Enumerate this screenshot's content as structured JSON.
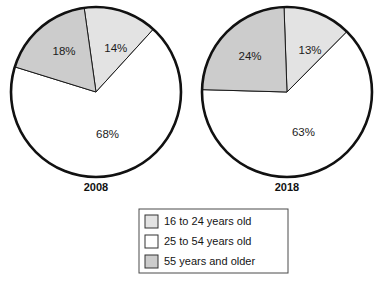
{
  "figure": {
    "title": "",
    "background": "#ffffff"
  },
  "colors": {
    "young": "#e3e3e3",
    "prime": "#ffffff",
    "older": "#cccccc",
    "outline": "#111111",
    "slice_stroke": "#1a1a1a",
    "text": "#141414",
    "legend_border": "#4a4a4a"
  },
  "chart_data": {
    "type": "pie",
    "title": "",
    "subtitle": "",
    "xlabel": "",
    "ylabel": "",
    "legend_position": "bottom-center",
    "grid": false,
    "categories": [
      "16 to 24 years old",
      "25 to 54 years old",
      "55 years and older"
    ],
    "charts": [
      {
        "name": "2008",
        "label": "2008",
        "center": {
          "x": 96,
          "y": 92
        },
        "radius": 85,
        "start_angle_deg": -8,
        "slices": [
          {
            "category": "16 to 24 years old",
            "value": 14,
            "label": "14%",
            "color_key": "young",
            "label_r_frac": 0.55,
            "label_dx": 6,
            "label_dy": 2
          },
          {
            "category": "25 to 54 years old",
            "value": 68,
            "label": "68%",
            "color_key": "prime",
            "label_r_frac": 0.52,
            "label_dx": 0,
            "label_dy": 0
          },
          {
            "category": "55 years and older",
            "value": 18,
            "label": "18%",
            "color_key": "older",
            "label_r_frac": 0.58,
            "label_dx": 0,
            "label_dy": -2
          }
        ]
      },
      {
        "name": "2018",
        "label": "2018",
        "center": {
          "x": 287,
          "y": 92
        },
        "radius": 85,
        "start_angle_deg": -2,
        "slices": [
          {
            "category": "16 to 24 years old",
            "value": 13,
            "label": "13%",
            "color_key": "young",
            "label_r_frac": 0.55,
            "label_dx": 6,
            "label_dy": 2
          },
          {
            "category": "25 to 54 years old",
            "value": 63,
            "label": "63%",
            "color_key": "prime",
            "label_r_frac": 0.52,
            "label_dx": 0,
            "label_dy": 0
          },
          {
            "category": "55 years and older",
            "value": 24,
            "label": "24%",
            "color_key": "older",
            "label_r_frac": 0.58,
            "label_dx": -2,
            "label_dy": 0
          }
        ]
      }
    ]
  },
  "legend": {
    "x": 139,
    "y": 209,
    "width": 149,
    "height": 64,
    "row_height": 20,
    "items": [
      {
        "label": "16 to 24 years old",
        "color_key": "young"
      },
      {
        "label": "25 to 54 years old",
        "color_key": "prime"
      },
      {
        "label": "55 years and older",
        "color_key": "older"
      }
    ]
  }
}
